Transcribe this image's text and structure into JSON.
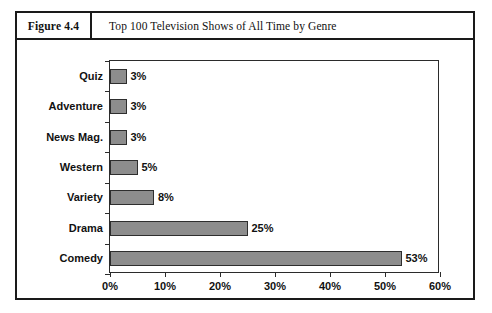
{
  "figure": {
    "number_label": "Figure 4.4",
    "title": "Top 100 Television Shows of All Time by Genre"
  },
  "chart_data": {
    "type": "bar",
    "orientation": "horizontal",
    "title": "Top 100 Television Shows of All Time by Genre",
    "xlabel": "",
    "ylabel": "",
    "categories": [
      "Comedy",
      "Drama",
      "Variety",
      "Western",
      "News Mag.",
      "Adventure",
      "Quiz"
    ],
    "values": [
      53,
      25,
      8,
      5,
      3,
      3,
      3
    ],
    "value_labels": [
      "53%",
      "25%",
      "8%",
      "5%",
      "3%",
      "3%",
      "3%"
    ],
    "xlim": [
      0,
      60
    ],
    "xticks": [
      0,
      10,
      20,
      30,
      40,
      50,
      60
    ],
    "xtick_labels": [
      "0%",
      "10%",
      "20%",
      "30%",
      "40%",
      "50%",
      "60%"
    ],
    "grid": false,
    "legend": false,
    "bar_color": "#8d8d8d",
    "bar_border_color": "#2e2e2e",
    "axis_color": "#2b2b2b"
  }
}
